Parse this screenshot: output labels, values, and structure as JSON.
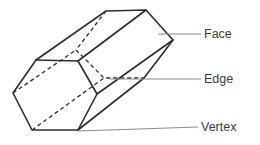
{
  "diagram": {
    "labels": {
      "face": "Face",
      "edge": "Edge",
      "vertex": "Vertex"
    },
    "colors": {
      "background": "#ffffff",
      "outline": "#2e2e2e",
      "leader_line": "#8c8c8c",
      "label_text": "#3d3d3d"
    }
  }
}
